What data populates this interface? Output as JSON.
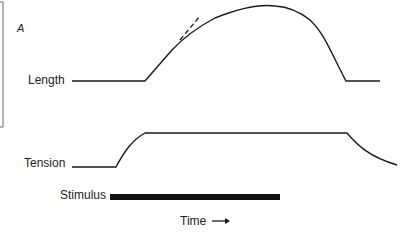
{
  "figure": {
    "panel_label": "A",
    "traces": {
      "length_label": "Length",
      "tension_label": "Tension",
      "stimulus_label": "Stimulus"
    },
    "axis": {
      "time_label": "Time",
      "time_arrow": "→"
    },
    "colors": {
      "line": "#1a1a1a",
      "bracket": "#666666",
      "background": "#ffffff"
    }
  }
}
